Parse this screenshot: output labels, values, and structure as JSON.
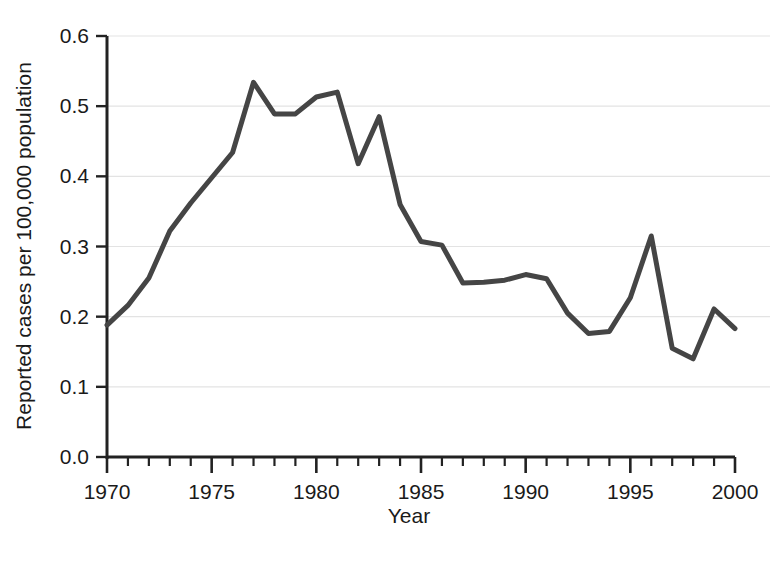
{
  "chart_data": {
    "type": "line",
    "title": "",
    "subtitle": "",
    "xlabel": "Year",
    "ylabel": "Reported cases per 100,000 population",
    "xlim": [
      1970,
      2000
    ],
    "ylim": [
      0.0,
      0.6
    ],
    "grid": "horizontal",
    "legend": "none",
    "x_tick_labels": [
      "1970",
      "1975",
      "1980",
      "1985",
      "1990",
      "1995",
      "2000"
    ],
    "x_tick_values": [
      1970,
      1975,
      1980,
      1985,
      1990,
      1995,
      2000
    ],
    "x_minor_tick_interval": 1,
    "y_tick_labels": [
      "0.0",
      "0.1",
      "0.2",
      "0.3",
      "0.4",
      "0.5",
      "0.6"
    ],
    "y_tick_values": [
      0.0,
      0.1,
      0.2,
      0.3,
      0.4,
      0.5,
      0.6
    ],
    "line_color": "#454545",
    "line_width": 5,
    "x": [
      1970,
      1971,
      1972,
      1973,
      1974,
      1975,
      1976,
      1977,
      1978,
      1979,
      1980,
      1981,
      1982,
      1983,
      1984,
      1985,
      1986,
      1987,
      1988,
      1989,
      1990,
      1991,
      1992,
      1993,
      1994,
      1995,
      1996,
      1997,
      1998,
      1999,
      2000
    ],
    "values": [
      0.188,
      0.216,
      0.255,
      0.322,
      0.362,
      0.398,
      0.434,
      0.534,
      0.489,
      0.489,
      0.513,
      0.52,
      0.418,
      0.485,
      0.36,
      0.307,
      0.302,
      0.248,
      0.249,
      0.252,
      0.26,
      0.254,
      0.205,
      0.176,
      0.179,
      0.227,
      0.315,
      0.155,
      0.14,
      0.211,
      0.183
    ],
    "series": [
      {
        "name": "Reported cases per 100,000 population",
        "values": [
          0.188,
          0.216,
          0.255,
          0.322,
          0.362,
          0.398,
          0.434,
          0.534,
          0.489,
          0.489,
          0.513,
          0.52,
          0.418,
          0.485,
          0.36,
          0.307,
          0.302,
          0.248,
          0.249,
          0.252,
          0.26,
          0.254,
          0.205,
          0.176,
          0.179,
          0.227,
          0.315,
          0.155,
          0.14,
          0.211,
          0.183
        ]
      }
    ]
  }
}
